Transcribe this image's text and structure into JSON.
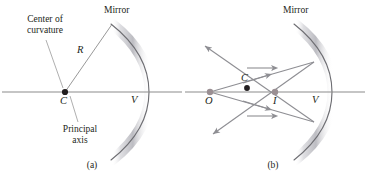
{
  "figure": {
    "background_color": "#ffffff",
    "ink_color": "#231f20",
    "axis_color": "#8c8c8c",
    "ray_color": "#8e8e93",
    "mirror_edge_color": "#6e6e73",
    "mirror_band_color": "#c9c9cd",
    "object_dot_color": "#9a8f93",
    "center_dot_color": "#231f20",
    "image_dot_color": "#9a8f93"
  },
  "panel_a": {
    "caption": "(a)",
    "labels": {
      "mirror": "Mirror",
      "center_of_curvature_line1": "Center of",
      "center_of_curvature_line2": "curvature",
      "radius": "R",
      "center_point": "C",
      "vertex": "V",
      "principal_axis_line1": "Principal",
      "principal_axis_line2": "axis"
    }
  },
  "panel_b": {
    "caption": "(b)",
    "labels": {
      "mirror": "Mirror",
      "object": "O",
      "center_point": "C",
      "image": "I",
      "vertex": "V"
    }
  }
}
